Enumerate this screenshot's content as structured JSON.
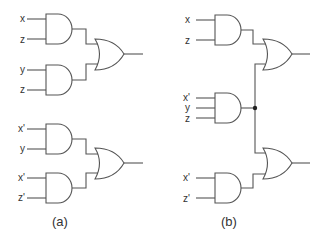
{
  "diagram": {
    "type": "logic-circuit",
    "colors": {
      "line": "#555555",
      "text": "#333333",
      "background": "#ffffff"
    },
    "panels": [
      {
        "caption": "(a)",
        "gates": [
          {
            "id": "a_and1",
            "type": "AND",
            "inputs": [
              "x",
              "z"
            ]
          },
          {
            "id": "a_and2",
            "type": "AND",
            "inputs": [
              "y",
              "z"
            ]
          },
          {
            "id": "a_or1",
            "type": "OR",
            "inputs": [
              "a_and1",
              "a_and2"
            ]
          },
          {
            "id": "a_and3",
            "type": "AND",
            "inputs": [
              "x'",
              "y"
            ]
          },
          {
            "id": "a_and4",
            "type": "AND",
            "inputs": [
              "x'",
              "z'"
            ]
          },
          {
            "id": "a_or2",
            "type": "OR",
            "inputs": [
              "a_and3",
              "a_and4"
            ]
          }
        ],
        "labels": {
          "and1_in1": "x",
          "and1_in2": "z",
          "and2_in1": "y",
          "and2_in2": "z",
          "and3_in1": "x'",
          "and3_in2": "y",
          "and4_in1": "x'",
          "and4_in2": "z'"
        }
      },
      {
        "caption": "(b)",
        "gates": [
          {
            "id": "b_and1",
            "type": "AND",
            "inputs": [
              "x",
              "z"
            ]
          },
          {
            "id": "b_and2",
            "type": "AND",
            "inputs": [
              "x'",
              "y",
              "z"
            ],
            "shared_output": true
          },
          {
            "id": "b_and3",
            "type": "AND",
            "inputs": [
              "x'",
              "z'"
            ]
          },
          {
            "id": "b_or1",
            "type": "OR",
            "inputs": [
              "b_and1",
              "b_and2"
            ]
          },
          {
            "id": "b_or2",
            "type": "OR",
            "inputs": [
              "b_and2",
              "b_and3"
            ]
          }
        ],
        "labels": {
          "and1_in1": "x",
          "and1_in2": "z",
          "and2_in1": "x'",
          "and2_in2": "y",
          "and2_in3": "z",
          "and3_in1": "x'",
          "and3_in2": "z'"
        }
      }
    ]
  }
}
